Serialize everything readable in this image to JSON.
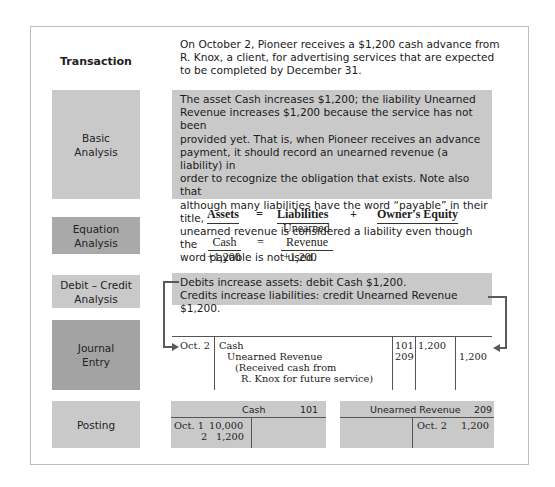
{
  "rows": {
    "transaction": {
      "label": "Transaction",
      "text_lines": [
        "On October 2, Pioneer receives a $1,200 cash advance from",
        "R. Knox, a client, for advertising services that are expected",
        "to be completed by December 31."
      ]
    },
    "basic_analysis": {
      "label_lines": [
        "Basic",
        "Analysis"
      ],
      "text_lines": [
        "The asset Cash increases $1,200; the liability Unearned",
        "Revenue increases $1,200 because the service has not been",
        "provided yet. That is, when Pioneer receives an advance",
        "payment, it should record an unearned revenue (a liability) in",
        "order to recognize the obligation that exists. Note also that",
        "although many liabilities have the word “payable” in their title,",
        "unearned revenue is considered a liability even though the",
        "word payable is not used."
      ]
    },
    "equation_analysis": {
      "label_lines": [
        "Equation",
        "Analysis"
      ],
      "headers": {
        "assets": "Assets",
        "equals": "=",
        "liabilities": "Liabilities",
        "plus": "+",
        "equity": "Owner's Equity"
      },
      "asset_account": "Cash",
      "equals2": "=",
      "liability_account_line1": "Unearned",
      "liability_account_line2": "Revenue",
      "asset_change": "+1,200",
      "liability_change": "+1,200"
    },
    "debit_credit_analysis": {
      "label_lines": [
        "Debit – Credit",
        "Analysis"
      ],
      "text_lines": [
        "Debits increase assets: debit Cash $1,200.",
        "Credits increase liabilities: credit Unearned Revenue $1,200."
      ]
    },
    "journal_entry": {
      "label_lines": [
        "Journal",
        "Entry"
      ],
      "date": "Oct. 2",
      "lines": [
        {
          "description": "Cash",
          "ref": "101",
          "debit": "1,200",
          "credit": ""
        },
        {
          "description": "Unearned Revenue",
          "ref": "209",
          "debit": "",
          "credit": "1,200"
        },
        {
          "description": "(Received cash from",
          "ref": "",
          "debit": "",
          "credit": ""
        },
        {
          "description": "R. Knox for future service)",
          "ref": "",
          "debit": "",
          "credit": ""
        }
      ]
    },
    "posting": {
      "label": "Posting",
      "accounts": [
        {
          "name": "Cash",
          "number": "101",
          "debit_entries": [
            {
              "date": "Oct. 1",
              "amount": "10,000"
            },
            {
              "date": "2",
              "amount": "1,200"
            }
          ],
          "credit_entries": []
        },
        {
          "name": "Unearned Revenue",
          "number": "209",
          "debit_entries": [],
          "credit_entries": [
            {
              "date": "Oct. 2",
              "amount": "1,200"
            }
          ]
        }
      ]
    }
  },
  "colors": {
    "panel_gray": "#c9c9c9",
    "label_dark": "#a6a6a6",
    "frame_border": "#bdbdbd",
    "connector": "#5a5a5a"
  }
}
